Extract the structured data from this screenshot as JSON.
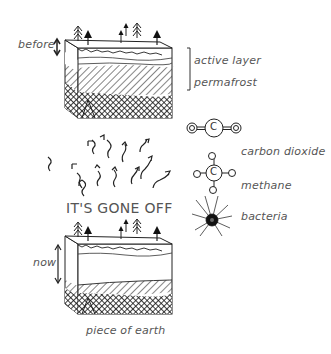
{
  "diagram": {
    "before_block": {
      "label": "before",
      "layers": [
        "active layer",
        "permafrost"
      ]
    },
    "center_caption": "IT'S GONE OFF",
    "legend": [
      {
        "icon": "carbon-dioxide-molecule-icon",
        "label": "carbon dioxide",
        "atoms": {
          "center": "C",
          "side": "O"
        }
      },
      {
        "icon": "methane-molecule-icon",
        "label": "methane",
        "atoms": {
          "center": "C",
          "side": "H"
        }
      },
      {
        "icon": "bacteria-icon",
        "label": "bacteria"
      }
    ],
    "now_block": {
      "label": "now",
      "caption": "piece of earth"
    },
    "colors": {
      "ink": "#222222",
      "text": "#555555",
      "background": "#ffffff"
    }
  }
}
